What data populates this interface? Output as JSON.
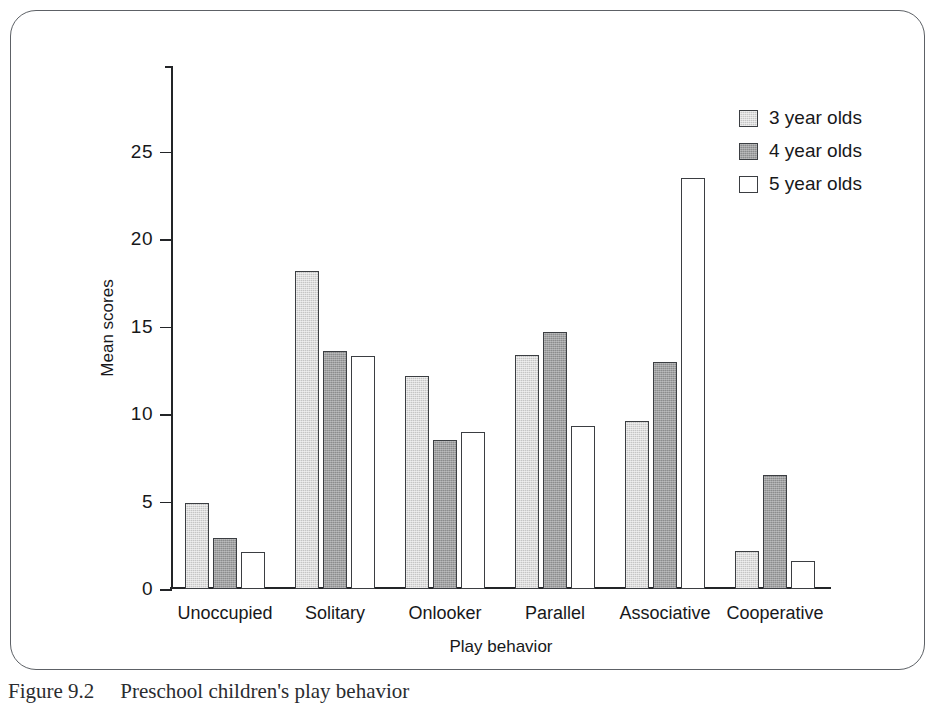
{
  "figure": {
    "caption_label": "Figure 9.2",
    "caption_text": "Preschool children's play behavior"
  },
  "chart_data": {
    "type": "bar",
    "title": "",
    "xlabel": "Play behavior",
    "ylabel": "Mean scores",
    "ylim": [
      0,
      29.9
    ],
    "yticks": [
      0,
      5,
      10,
      15,
      20,
      25
    ],
    "grid": false,
    "legend_position": "top-right",
    "categories": [
      "Unoccupied",
      "Solitary",
      "Onlooker",
      "Parallel",
      "Associative",
      "Cooperative"
    ],
    "series": [
      {
        "name": "3 year olds",
        "color": "#c5c5c5",
        "values": [
          4.9,
          18.2,
          12.2,
          13.4,
          9.6,
          2.2
        ]
      },
      {
        "name": "4 year olds",
        "color": "#8b8c8d",
        "values": [
          2.9,
          13.6,
          8.5,
          14.7,
          13.0,
          6.5
        ]
      },
      {
        "name": "5 year olds",
        "color": "#ffffff",
        "values": [
          2.1,
          13.3,
          9.0,
          9.3,
          23.5,
          1.6
        ]
      }
    ]
  }
}
